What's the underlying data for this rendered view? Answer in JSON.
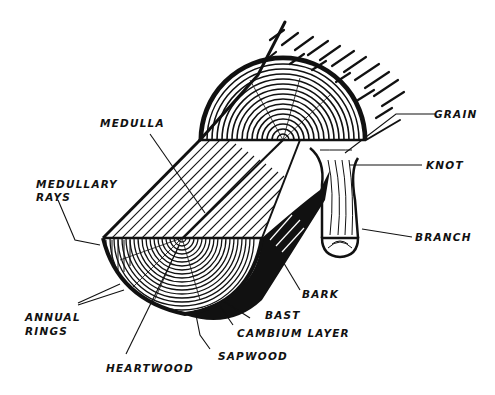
{
  "diagram": {
    "colors": {
      "ink": "#111111",
      "paper": "#ffffff"
    },
    "labels": {
      "medulla": "MEDULLA",
      "medullary_rays_1": "MEDULLARY",
      "medullary_rays_2": "RAYS",
      "annual_rings_1": "ANNUAL",
      "annual_rings_2": "RINGS",
      "heartwood": "HEARTWOOD",
      "sapwood": "SAPWOOD",
      "cambium_layer": "CAMBIUM LAYER",
      "bast": "BAST",
      "bark": "BARK",
      "grain": "GRAIN",
      "knot": "KNOT",
      "branch": "BRANCH"
    }
  }
}
